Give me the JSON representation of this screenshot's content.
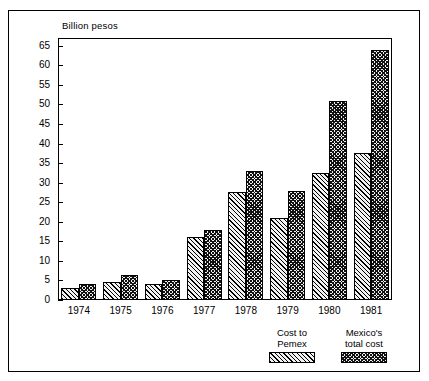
{
  "chart_data": {
    "type": "bar",
    "title": "",
    "subtitle": "",
    "xlabel": "",
    "ylabel": "Billion pesos",
    "ylim": [
      0,
      67
    ],
    "yticks": [
      0,
      5,
      10,
      15,
      20,
      25,
      30,
      35,
      40,
      45,
      50,
      55,
      60,
      65
    ],
    "ytick_labels": [
      "0",
      "5",
      "10",
      "15",
      "20",
      "25",
      "30",
      "35",
      "40",
      "45",
      "50",
      "55",
      "60",
      "65"
    ],
    "grid": false,
    "legend_position": "bottom-right",
    "categories": [
      "1974",
      "1975",
      "1976",
      "1977",
      "1978",
      "1979",
      "1980",
      "1981"
    ],
    "series": [
      {
        "name": "Cost to\nPemex",
        "pattern": "diagonal-hatch",
        "values": [
          3.0,
          4.5,
          4.0,
          16.0,
          27.5,
          21.0,
          32.5,
          37.5
        ]
      },
      {
        "name": "Mexico's\ntotal cost",
        "pattern": "crosshatch",
        "values": [
          4.0,
          6.3,
          5.0,
          17.8,
          33.0,
          28.0,
          51.0,
          64.0
        ]
      }
    ]
  },
  "legend": {
    "items": [
      {
        "label": "Cost to\nPemex",
        "pattern": "diagonal-hatch"
      },
      {
        "label": "Mexico's\ntotal cost",
        "pattern": "crosshatch"
      }
    ]
  }
}
